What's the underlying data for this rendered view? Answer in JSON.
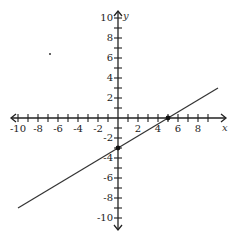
{
  "chart_data": {
    "type": "line",
    "title": "",
    "xlabel": "x",
    "ylabel": "y",
    "xlim": [
      -10,
      10
    ],
    "ylim": [
      -10,
      10
    ],
    "grid": false,
    "x_ticks": [
      -10,
      -9,
      -8,
      -7,
      -6,
      -5,
      -4,
      -3,
      -2,
      -1,
      1,
      2,
      3,
      4,
      5,
      6,
      7,
      8,
      9
    ],
    "x_tick_labels": [
      "-10",
      "-8",
      "-6",
      "-4",
      "-2",
      "2",
      "4",
      "6",
      "8"
    ],
    "y_ticks": [
      -10,
      -9,
      -8,
      -7,
      -6,
      -5,
      -4,
      -3,
      -2,
      -1,
      1,
      2,
      3,
      4,
      5,
      6,
      7,
      8,
      9,
      10
    ],
    "y_tick_labels": [
      "10",
      "8",
      "6",
      "4",
      "2",
      "-2",
      "-4",
      "-6",
      "-8",
      "-10"
    ],
    "series": [
      {
        "name": "line",
        "equation": "y = 0.6x - 3",
        "x": [
          -10,
          10
        ],
        "y": [
          -9,
          3
        ],
        "color": "#333333"
      }
    ],
    "points": [
      {
        "label": "y-intercept",
        "x": 0,
        "y": -3
      },
      {
        "label": "x-intercept",
        "x": 5,
        "y": 0
      }
    ]
  },
  "labels": {
    "x_axis": "x",
    "y_axis": "y",
    "x_ticks": {
      "n10": "-10",
      "n8": "-8",
      "n6": "-6",
      "n4": "-4",
      "n2": "-2",
      "p2": "2",
      "p4": "4",
      "p6": "6",
      "p8": "8"
    },
    "y_ticks": {
      "p10": "10",
      "p8": "8",
      "p6": "6",
      "p4": "4",
      "p2": "2",
      "n2": "-2",
      "n4": "-4",
      "n6": "-6",
      "n8": "-8",
      "n10": "-10"
    }
  },
  "colors": {
    "axis": "#222222",
    "line": "#333333",
    "point": "#111111"
  }
}
